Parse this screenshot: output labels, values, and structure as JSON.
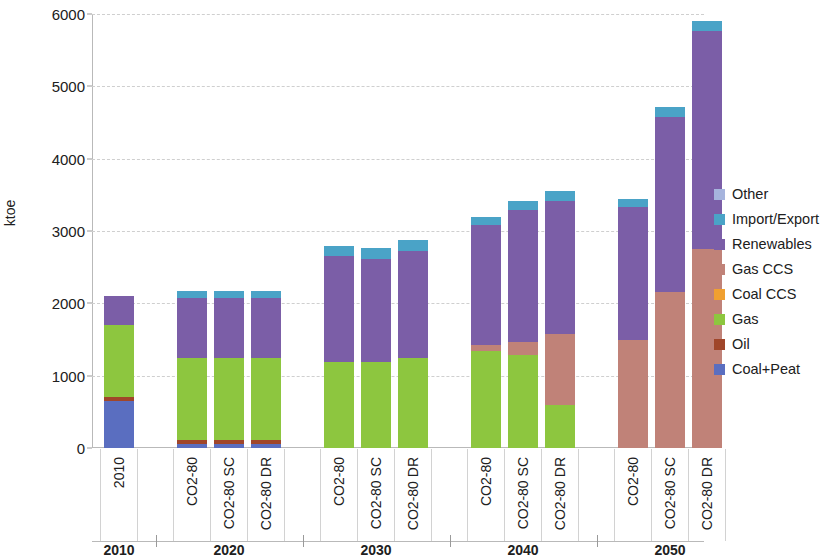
{
  "chart_data": {
    "type": "bar",
    "stacked": true,
    "title": "",
    "xlabel": "",
    "ylabel": "ktoe",
    "ylim": [
      0,
      6000
    ],
    "yticks": [
      0,
      1000,
      2000,
      3000,
      4000,
      5000,
      6000
    ],
    "ytick_labels": [
      "0",
      "1000",
      "2000",
      "3000",
      "4000",
      "5000",
      "6000"
    ],
    "grid": true,
    "legend_position": "right",
    "categories": [
      "2010",
      "CO2-80",
      "CO2-80 SC",
      "CO2-80 DR",
      "CO2-80",
      "CO2-80 SC",
      "CO2-80 DR",
      "CO2-80",
      "CO2-80 SC",
      "CO2-80 DR",
      "CO2-80",
      "CO2-80 SC",
      "CO2-80 DR"
    ],
    "groups": [
      {
        "label": "2010",
        "count": 1
      },
      {
        "label": "2020",
        "count": 3
      },
      {
        "label": "2030",
        "count": 3
      },
      {
        "label": "2040",
        "count": 3
      },
      {
        "label": "2050",
        "count": 3
      }
    ],
    "series": [
      {
        "name": "Coal+Peat",
        "color": "#5a6ec0",
        "values": [
          650,
          60,
          60,
          60,
          0,
          0,
          0,
          0,
          0,
          0,
          0,
          0,
          0
        ]
      },
      {
        "name": "Oil",
        "color": "#a0462a",
        "values": [
          60,
          55,
          55,
          55,
          0,
          0,
          0,
          0,
          0,
          0,
          0,
          0,
          0
        ]
      },
      {
        "name": "Gas",
        "color": "#8dc63f",
        "values": [
          990,
          1135,
          1135,
          1130,
          1190,
          1190,
          1240,
          1340,
          1290,
          600,
          0,
          0,
          0
        ]
      },
      {
        "name": "Coal CCS",
        "color": "#f0a030",
        "values": [
          0,
          0,
          0,
          0,
          0,
          0,
          0,
          0,
          0,
          0,
          0,
          0,
          0
        ]
      },
      {
        "name": "Gas CCS",
        "color": "#c08278",
        "values": [
          0,
          0,
          0,
          0,
          0,
          0,
          0,
          80,
          180,
          980,
          1500,
          2150,
          2750
        ]
      },
      {
        "name": "Renewables",
        "color": "#7b5ea7",
        "values": [
          400,
          830,
          830,
          830,
          1460,
          1420,
          1480,
          1660,
          1820,
          1840,
          1830,
          2430,
          3010
        ]
      },
      {
        "name": "Import/Export",
        "color": "#4aa3c7",
        "values": [
          0,
          90,
          90,
          90,
          150,
          150,
          155,
          115,
          120,
          140,
          110,
          130,
          150
        ]
      },
      {
        "name": "Other",
        "color": "#a6b4dd",
        "values": [
          0,
          0,
          0,
          0,
          0,
          0,
          0,
          0,
          0,
          0,
          0,
          0,
          0
        ]
      }
    ],
    "totals": [
      2100,
      2170,
      2170,
      2165,
      2800,
      2760,
      2875,
      3195,
      3410,
      3560,
      3440,
      4710,
      5910
    ]
  },
  "legend": {
    "items": [
      {
        "label": "Other",
        "color": "#a6b4dd"
      },
      {
        "label": "Import/Export",
        "color": "#4aa3c7"
      },
      {
        "label": "Renewables",
        "color": "#7b5ea7"
      },
      {
        "label": "Gas CCS",
        "color": "#c08278"
      },
      {
        "label": "Coal CCS",
        "color": "#f0a030"
      },
      {
        "label": "Gas",
        "color": "#8dc63f"
      },
      {
        "label": "Oil",
        "color": "#a0462a"
      },
      {
        "label": "Coal+Peat",
        "color": "#5a6ec0"
      }
    ]
  }
}
